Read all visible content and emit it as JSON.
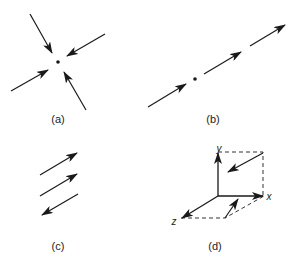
{
  "figure": {
    "panels": [
      {
        "id": "a",
        "label": "(a)",
        "description": "Four arrows converging toward a central point"
      },
      {
        "id": "b",
        "label": "(b)",
        "description": "Collinear arrows along one line through a point, all pointing the same direction"
      },
      {
        "id": "c",
        "label": "(c)",
        "description": "Three parallel arrows, two forward and one reversed"
      },
      {
        "id": "d",
        "label": "(d)",
        "description": "3D coordinate axes with arrows in the xy plane and xz plane"
      }
    ],
    "axes": {
      "x": "x",
      "y": "y",
      "z": "z"
    },
    "colors": {
      "stroke": "#1a1a1a",
      "dash": "#333333",
      "background": "#ffffff"
    }
  }
}
